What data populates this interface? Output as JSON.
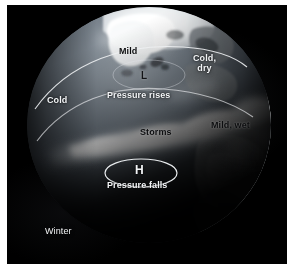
{
  "figure": {
    "kind": "satellite-globe-weather-diagram",
    "season_caption": "Winter",
    "background_color": "#000000",
    "frame_color": "#ffffff"
  },
  "globe": {
    "view": "north-atlantic-arctic",
    "ocean_color": "#5d6670",
    "land_color": "#8a8f92",
    "ice_color": "#f4f6f7",
    "cloud_color": "#f0f3f5",
    "terminator_shadow": "#07080a"
  },
  "annotations": {
    "mild": "Mild",
    "cold_dry": "Cold,\ndry",
    "cold": "Cold",
    "pressure_rises": "Pressure rises",
    "storms": "Storms",
    "mild_wet": "Mild, wet",
    "pressure_falls": "Pressure falls",
    "low_marker": "L",
    "high_marker": "H"
  },
  "legend_markers": [
    {
      "symbol": "L",
      "meaning": "Pressure rises",
      "kind": "low-pressure-center"
    },
    {
      "symbol": "H",
      "meaning": "Pressure falls",
      "kind": "high-pressure-center"
    }
  ],
  "arcs": [
    {
      "name": "upper-boundary-arc",
      "color": "#e8eaec"
    },
    {
      "name": "lower-boundary-arc",
      "color": "#e8eaec"
    }
  ]
}
